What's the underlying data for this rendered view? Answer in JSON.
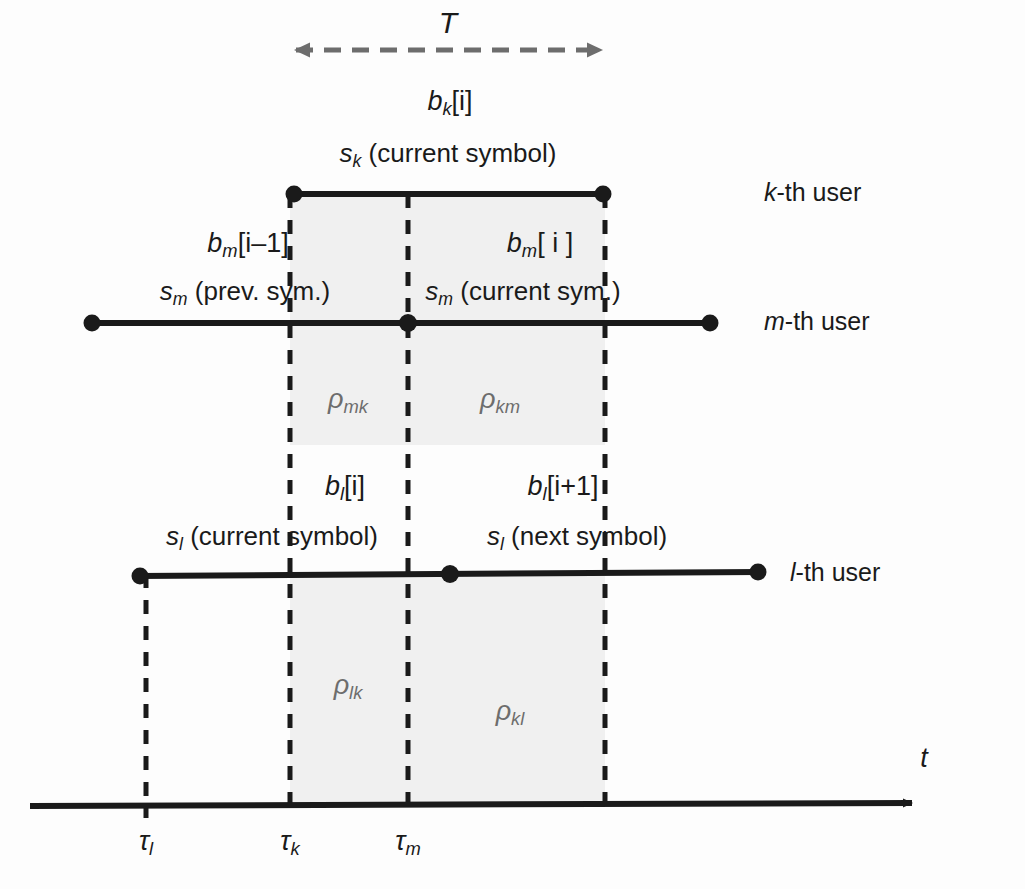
{
  "figure": {
    "axis_label": "t",
    "interval_label": "T"
  },
  "colors": {
    "ink": "#1a1a1a",
    "shade": "#f0f0f0",
    "arrow_gray": "#6d6d6d",
    "background": "#fdfdfd"
  },
  "users": [
    {
      "id": "k",
      "label_prefix": "k",
      "label_suffix": "-th user"
    },
    {
      "id": "m",
      "label_prefix": "m",
      "label_suffix": "-th user"
    },
    {
      "id": "l",
      "label_prefix": "l",
      "label_suffix": "-th user"
    }
  ],
  "user_labels": {
    "k": "k-th user",
    "m": "m-th user",
    "l": "l-th user"
  },
  "bit_labels": {
    "k_current": {
      "base": "b",
      "sub": "k",
      "index": "[i]"
    },
    "m_previous": {
      "base": "b",
      "sub": "m",
      "index": "[i–1]"
    },
    "m_current": {
      "base": "b",
      "sub": "m",
      "index": "[ i ]"
    },
    "l_current": {
      "base": "b",
      "sub": "l",
      "index": "[i]"
    },
    "l_next": {
      "base": "b",
      "sub": "l",
      "index": "[i+1]"
    }
  },
  "symbol_labels": {
    "k_current": {
      "base": "s",
      "sub": "k",
      "text": " (current symbol)"
    },
    "m_previous": {
      "base": "s",
      "sub": "m",
      "text": " (prev. sym.)"
    },
    "m_current": {
      "base": "s",
      "sub": "m",
      "text": " (current sym.)"
    },
    "l_current": {
      "base": "s",
      "sub": "l",
      "text": " (current symbol)"
    },
    "l_next": {
      "base": "s",
      "sub": "l",
      "text": " (next symbol)"
    }
  },
  "correlations": [
    {
      "base": "ρ",
      "sub": "mk",
      "x": 348,
      "y": 402
    },
    {
      "base": "ρ",
      "sub": "km",
      "x": 500,
      "y": 402
    },
    {
      "base": "ρ",
      "sub": "lk",
      "x": 348,
      "y": 688
    },
    {
      "base": "ρ",
      "sub": "kl",
      "x": 510,
      "y": 714
    }
  ],
  "time_markers": [
    {
      "base": "τ",
      "sub": "l",
      "x": 146
    },
    {
      "base": "τ",
      "sub": "k",
      "x": 290
    },
    {
      "base": "τ",
      "sub": "m",
      "x": 408
    }
  ],
  "geometry": {
    "axis_y": 805,
    "axis_x_start": 30,
    "axis_x_end": 920,
    "tau_l_x": 146,
    "tau_k_x": 290,
    "tau_m_x": 408,
    "tau_end_x": 605,
    "k_line_y": 194,
    "k_line_x1": 292,
    "k_line_x2": 605,
    "m_line_y": 323,
    "m_line_x1": 90,
    "m_line_x2": 712,
    "m_dot_x": 408,
    "l_line_y": 574,
    "l_line_x1": 138,
    "l_line_x2": 760,
    "l_dot_x": 450,
    "T_arrow_y": 50,
    "shade_upper_top": 194,
    "shade_upper_bottom": 445,
    "shade_lower_top": 574,
    "shade_lower_bottom": 805
  }
}
